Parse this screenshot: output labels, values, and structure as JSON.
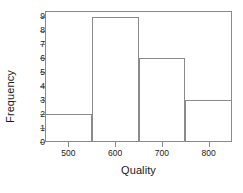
{
  "chart_data": {
    "type": "bar",
    "title": "",
    "xlabel": "Quality",
    "ylabel": "Frequency",
    "categories": [
      "450-550",
      "550-650",
      "650-750",
      "750-850"
    ],
    "values": [
      2,
      9,
      6,
      3
    ],
    "bin_edges": [
      450,
      550,
      650,
      750,
      850
    ],
    "xlim": [
      450,
      850
    ],
    "ylim": [
      0,
      9.4
    ],
    "xticks": [
      500,
      600,
      700,
      800
    ],
    "xtick_labels": [
      "500",
      "600",
      "700",
      "800"
    ],
    "yticks": [
      0,
      1,
      2,
      3,
      4,
      5,
      6,
      7,
      8,
      9
    ],
    "ytick_labels": [
      "0",
      "1",
      "2",
      "3",
      "4",
      "5",
      "6",
      "7",
      "8",
      "9"
    ],
    "grid": false,
    "legend": false,
    "colors": {
      "line": "#8a8a8a",
      "background": "#ffffff",
      "text": "#1a1a1a"
    }
  }
}
